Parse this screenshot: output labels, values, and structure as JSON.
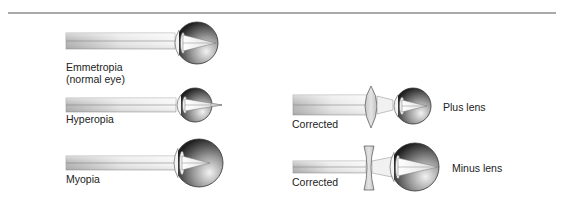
{
  "figure": {
    "type": "refractive-errors-eye-diagram",
    "panels": [
      {
        "id": "emmetropia",
        "label_lines": [
          "Emmetropia",
          "(normal eye)"
        ],
        "focus": "on-retina"
      },
      {
        "id": "hyperopia",
        "label_lines": [
          "Hyperopia"
        ],
        "focus": "behind-retina"
      },
      {
        "id": "myopia",
        "label_lines": [
          "Myopia"
        ],
        "focus": "in-front-of-retina"
      },
      {
        "id": "hyperopia-corrected",
        "label_lines": [
          "Corrected"
        ],
        "lens_label": "Plus lens",
        "lens_type": "convex"
      },
      {
        "id": "myopia-corrected",
        "label_lines": [
          "Corrected"
        ],
        "lens_label": "Minus lens",
        "lens_type": "concave"
      }
    ]
  },
  "colors": {
    "rule": "#555555",
    "beam_light": "#f2f2f2",
    "beam_dark": "#b8b8b8",
    "eye_dark": "#2a2a2a",
    "eye_light": "#e8e8e8",
    "text": "#222222"
  }
}
